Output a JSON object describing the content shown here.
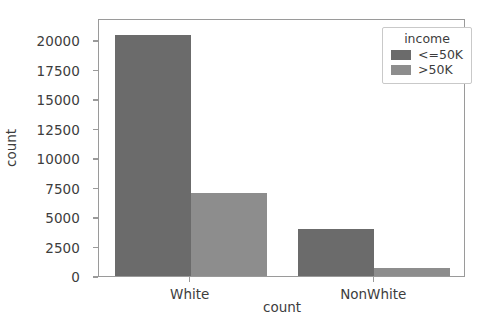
{
  "chart_data": {
    "type": "bar",
    "title": "",
    "xlabel": "count",
    "ylabel": "count",
    "categories": [
      "White",
      "NonWhite"
    ],
    "series": [
      {
        "name": "<=50K",
        "values": [
          20400,
          4000
        ],
        "color": "#6b6b6b"
      },
      {
        "name": ">50K",
        "values": [
          7050,
          700
        ],
        "color": "#8d8d8d"
      }
    ],
    "ylim": [
      0,
      21500
    ],
    "yticks": [
      0,
      2500,
      5000,
      7500,
      10000,
      12500,
      15000,
      17500,
      20000
    ],
    "ytick_labels": [
      "0",
      "2500",
      "5000",
      "7500",
      "10000",
      "12500",
      "15000",
      "17500",
      "20000"
    ],
    "xtick_labels": [
      "White",
      "NonWhite"
    ],
    "grid": false,
    "legend": {
      "title": "income",
      "position": "upper right",
      "entries": [
        {
          "label": "<=50K",
          "color": "#6b6b6b"
        },
        {
          "label": ">50K",
          "color": "#8d8d8d"
        }
      ]
    }
  },
  "colors": {
    "background": "#ffffff",
    "axis": "#9a9a9a",
    "text": "#3d3d3d",
    "bar_dark": "#6b6b6b",
    "bar_light": "#8d8d8d"
  }
}
